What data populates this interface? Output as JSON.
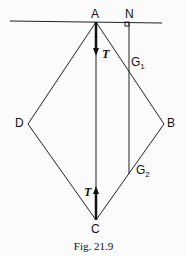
{
  "labels": {
    "A": "A",
    "N": "N",
    "B": "B",
    "C": "C",
    "D": "D",
    "G1": "G",
    "G1_sub": "1",
    "G2": "G",
    "G2_sub": "2",
    "T_top": "T",
    "T_bottom": "T"
  },
  "caption": "Fig. 21.9"
}
